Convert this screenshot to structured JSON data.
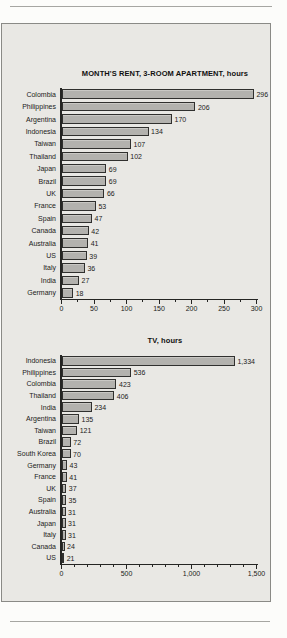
{
  "style": {
    "page_background": "#fcfcfa",
    "panel_background": "#e9e8e4",
    "panel_border": "#8a8a86",
    "bar_fill": "#b3b2ae",
    "bar_border": "#30302e",
    "axis_color": "#252523",
    "text_color": "#1b1b19",
    "rule_color": "#a6a6a2"
  },
  "chart_data": [
    {
      "type": "bar",
      "orientation": "horizontal",
      "title": "MONTH'S RENT, 3-ROOM APARTMENT, hours",
      "categories": [
        "Colombia",
        "Philippines",
        "Argentina",
        "Indonesia",
        "Taiwan",
        "Thailand",
        "Japan",
        "Brazil",
        "UK",
        "France",
        "Spain",
        "Canada",
        "Australia",
        "US",
        "Italy",
        "India",
        "Germany"
      ],
      "values": [
        296,
        206,
        170,
        134,
        107,
        102,
        69,
        69,
        66,
        53,
        47,
        42,
        41,
        39,
        36,
        27,
        18
      ],
      "value_labels": [
        "296",
        "206",
        "170",
        "134",
        "107",
        "102",
        "69",
        "69",
        "66",
        "53",
        "47",
        "42",
        "41",
        "39",
        "36",
        "27",
        "18"
      ],
      "xlabel": "",
      "ylabel": "",
      "xlim": [
        0,
        300
      ],
      "x_major_ticks": [
        0,
        50,
        100,
        150,
        200,
        250,
        300
      ],
      "x_major_tick_labels": [
        "0",
        "50",
        "100",
        "150",
        "200",
        "250",
        "300"
      ],
      "x_minor_step": 25,
      "grid": false,
      "legend": "none",
      "layout": {
        "rows_top_px": 20,
        "row_height_px": 12.41,
        "bar_height_px": 9.5,
        "plot_width_px": 195,
        "label_col_px": 58
      }
    },
    {
      "type": "bar",
      "orientation": "horizontal",
      "title": "TV, hours",
      "categories": [
        "Indonesia",
        "Philippines",
        "Colombia",
        "Thailand",
        "India",
        "Argentina",
        "Taiwan",
        "Brazil",
        "South Korea",
        "Germany",
        "France",
        "UK",
        "Spain",
        "Australia",
        "Japan",
        "Italy",
        "Canada",
        "US"
      ],
      "values": [
        1334,
        536,
        423,
        406,
        234,
        135,
        121,
        72,
        70,
        43,
        41,
        37,
        35,
        31,
        31,
        31,
        24,
        21
      ],
      "value_labels": [
        "1,334",
        "536",
        "423",
        "406",
        "234",
        "135",
        "121",
        "72",
        "70",
        "43",
        "41",
        "37",
        "35",
        "31",
        "31",
        "31",
        "24",
        "21"
      ],
      "xlabel": "",
      "ylabel": "",
      "xlim": [
        0,
        1500
      ],
      "x_major_ticks": [
        0,
        500,
        1000,
        1500
      ],
      "x_major_tick_labels": [
        "0",
        "500",
        "1,000",
        "1,500"
      ],
      "x_minor_step": 100,
      "grid": false,
      "legend": "none",
      "layout": {
        "rows_top_px": 20,
        "row_height_px": 11.6,
        "bar_height_px": 9.5,
        "plot_width_px": 195,
        "label_col_px": 58
      }
    }
  ]
}
